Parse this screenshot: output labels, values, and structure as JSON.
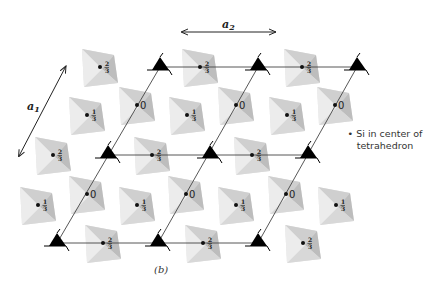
{
  "figure": {
    "caption": "(b)",
    "vectors": [
      {
        "name": "a",
        "subscript": "2",
        "label": "a2"
      },
      {
        "name": "a",
        "subscript": "1",
        "label": "a1"
      }
    ],
    "legend": {
      "marker": "•",
      "line1": "Si in center of",
      "line2": "tetrahedron"
    },
    "height_labels": {
      "zero": "0",
      "one_third_num": "1",
      "one_third_den": "3",
      "two_thirds_num": "2",
      "two_thirds_den": "3"
    },
    "tetrahedra": [
      {
        "x": 100,
        "y": 67,
        "height": "2/3"
      },
      {
        "x": 200,
        "y": 67,
        "height": "2/3"
      },
      {
        "x": 302,
        "y": 67,
        "height": "2/3"
      },
      {
        "x": 87,
        "y": 115,
        "height": "1/3"
      },
      {
        "x": 137,
        "y": 105,
        "height": "0"
      },
      {
        "x": 187,
        "y": 115,
        "height": "1/3"
      },
      {
        "x": 236,
        "y": 105,
        "height": "0"
      },
      {
        "x": 287,
        "y": 115,
        "height": "1/3"
      },
      {
        "x": 335,
        "y": 105,
        "height": "0"
      },
      {
        "x": 53,
        "y": 155,
        "height": "2/3"
      },
      {
        "x": 152,
        "y": 155,
        "height": "2/3"
      },
      {
        "x": 252,
        "y": 155,
        "height": "2/3"
      },
      {
        "x": 38,
        "y": 205,
        "height": "1/3"
      },
      {
        "x": 87,
        "y": 194,
        "height": "0"
      },
      {
        "x": 137,
        "y": 205,
        "height": "1/3"
      },
      {
        "x": 186,
        "y": 194,
        "height": "0"
      },
      {
        "x": 236,
        "y": 205,
        "height": "1/3"
      },
      {
        "x": 286,
        "y": 194,
        "height": "0"
      },
      {
        "x": 336,
        "y": 205,
        "height": "1/3"
      },
      {
        "x": 103,
        "y": 243,
        "height": "2/3"
      },
      {
        "x": 203,
        "y": 243,
        "height": "2/3"
      },
      {
        "x": 303,
        "y": 243,
        "height": "2/3"
      }
    ],
    "threefold_axes": [
      {
        "x": 160,
        "y": 67
      },
      {
        "x": 258,
        "y": 67
      },
      {
        "x": 357,
        "y": 67
      },
      {
        "x": 108,
        "y": 155
      },
      {
        "x": 210,
        "y": 155
      },
      {
        "x": 308,
        "y": 155
      },
      {
        "x": 57,
        "y": 243
      },
      {
        "x": 158,
        "y": 243
      },
      {
        "x": 258,
        "y": 243
      }
    ]
  }
}
